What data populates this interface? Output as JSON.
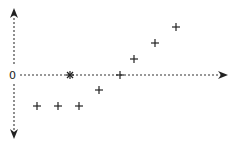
{
  "diagram": {
    "origin_label": "0",
    "colors": {
      "ink": "#222222",
      "background": "#ffffff"
    },
    "axes": {
      "x": {
        "from": [
          22,
          75
        ],
        "to": [
          227,
          75
        ],
        "style": "dashed",
        "arrow": "end"
      },
      "y": {
        "from": [
          14,
          10
        ],
        "to": [
          14,
          137
        ],
        "style": "dashed",
        "arrow": "both"
      }
    },
    "origin_marker": {
      "symbol": "asterisk",
      "pos": [
        70,
        75
      ]
    },
    "points": [
      {
        "symbol": "plus",
        "pos": [
          37,
          106
        ]
      },
      {
        "symbol": "plus",
        "pos": [
          58,
          106
        ]
      },
      {
        "symbol": "plus",
        "pos": [
          79,
          106
        ]
      },
      {
        "symbol": "plus",
        "pos": [
          99,
          90
        ]
      },
      {
        "symbol": "plus",
        "pos": [
          120,
          75
        ]
      },
      {
        "symbol": "plus",
        "pos": [
          134,
          59
        ]
      },
      {
        "symbol": "plus",
        "pos": [
          155,
          43
        ]
      },
      {
        "symbol": "plus",
        "pos": [
          176,
          27
        ]
      }
    ]
  }
}
